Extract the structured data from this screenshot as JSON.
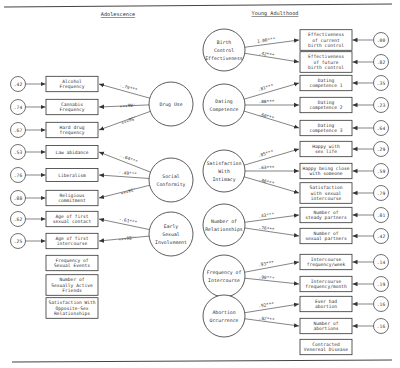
{
  "headers": {
    "left": "Adolescence",
    "right": "Young Adulthood"
  },
  "adolescence": {
    "latents": [
      {
        "id": "drug-use",
        "label": [
          "Drug Use"
        ],
        "cx": 171,
        "cy": 104,
        "r": 22,
        "indicators": [
          {
            "label": [
              "Alcohol",
              "Frequency"
            ],
            "coef": "-.79***",
            "error": ".42",
            "y": 84
          },
          {
            "label": [
              "Cannabis",
              "Frequency"
            ],
            "coef": ".86***",
            "error": ".74",
            "y": 107
          },
          {
            "label": [
              "Hard drug",
              "frequency"
            ],
            "coef": ".58***",
            "error": ".67",
            "y": 130
          }
        ]
      },
      {
        "id": "social-conformity",
        "label": [
          "Social",
          "Conformity"
        ],
        "cx": 171,
        "cy": 180,
        "r": 22,
        "indicators": [
          {
            "label": [
              "Law abidance"
            ],
            "coef": "-.64***",
            "error": ".53",
            "y": 152
          },
          {
            "label": [
              "Liberalism"
            ],
            "coef": "-.49***",
            "error": ".76",
            "y": 175
          },
          {
            "label": [
              "Religious",
              "commitment"
            ],
            "coef": ".34***",
            "error": ".88",
            "y": 198
          }
        ]
      },
      {
        "id": "early-sexual-involvement",
        "label": [
          "Early",
          "Sexual",
          "Involvement"
        ],
        "cx": 171,
        "cy": 234,
        "r": 22,
        "indicators": [
          {
            "label": [
              "Age of first",
              "sexual contact"
            ],
            "coef": "-.61***",
            "error": ".62",
            "y": 219
          },
          {
            "label": [
              "Age of first",
              "intercourse"
            ],
            "coef": "-.86***",
            "error": ".25",
            "y": 241
          }
        ]
      }
    ],
    "standalone_boxes": [
      {
        "label": [
          "Frequency of",
          "Sexual Events"
        ],
        "y": 263
      },
      {
        "label": [
          "Number of",
          "Sexually Active",
          "Friends"
        ],
        "y": 285
      },
      {
        "label": [
          "Satisfaction With",
          "Opposite-Sex",
          "Relationships"
        ],
        "y": 308
      }
    ]
  },
  "young_adulthood": {
    "latents": [
      {
        "id": "birth-control-effectiveness",
        "label": [
          "Birth",
          "Control",
          "Effectiveness"
        ],
        "cx": 224,
        "cy": 50,
        "r": 21,
        "indicators": [
          {
            "label": [
              "Effectiveness",
              "of current",
              "birth control"
            ],
            "coef": "1.00***",
            "error": ".00",
            "y": 40
          },
          {
            "label": [
              "Effectiveness",
              "of future",
              "birth control"
            ],
            "coef": ".42***",
            "error": ".82",
            "y": 62
          }
        ]
      },
      {
        "id": "dating-competence",
        "label": [
          "Dating",
          "Competence"
        ],
        "cx": 224,
        "cy": 105,
        "r": 21,
        "indicators": [
          {
            "label": [
              "Dating",
              "competence 1"
            ],
            "coef": ".81***",
            "error": ".35",
            "y": 83
          },
          {
            "label": [
              "Dating",
              "competence 2"
            ],
            "coef": ".88***",
            "error": ".23",
            "y": 105
          },
          {
            "label": [
              "Dating",
              "competence 3"
            ],
            "coef": ".60***",
            "error": ".64",
            "y": 128
          }
        ]
      },
      {
        "id": "satisfaction-with-intimacy",
        "label": [
          "Satisfaction",
          "With",
          "Intimacy"
        ],
        "cx": 224,
        "cy": 171,
        "r": 21,
        "indicators": [
          {
            "label": [
              "Happy with",
              "sex life"
            ],
            "coef": ".85***",
            "error": ".29",
            "y": 149
          },
          {
            "label": [
              "Happy being close",
              "with someone"
            ],
            "coef": ".63***",
            "error": ".59",
            "y": 171
          },
          {
            "label": [
              "Satisfaction",
              "with sexual",
              "intercourse"
            ],
            "coef": ".46***",
            "error": ".79",
            "y": 193
          }
        ]
      },
      {
        "id": "number-of-relationships",
        "label": [
          "Number of",
          "Relationships"
        ],
        "cx": 224,
        "cy": 225,
        "r": 21,
        "indicators": [
          {
            "label": [
              "Number of",
              "steady partners"
            ],
            "coef": ".43***",
            "error": ".81",
            "y": 215
          },
          {
            "label": [
              "Number of",
              "sexual partners"
            ],
            "coef": ".76***",
            "error": ".42",
            "y": 236
          }
        ]
      },
      {
        "id": "frequency-of-intercourse",
        "label": [
          "Frequency of",
          "Intercourse"
        ],
        "cx": 224,
        "cy": 276,
        "r": 21,
        "indicators": [
          {
            "label": [
              "Intercourse",
              "frequency/week"
            ],
            "coef": ".93***",
            "error": ".14",
            "y": 262
          },
          {
            "label": [
              "Intercourse",
              "frequency/month"
            ],
            "coef": ".90***",
            "error": ".19",
            "y": 284
          }
        ]
      },
      {
        "id": "abortion-occurrence",
        "label": [
          "Abortion",
          "Occurrence"
        ],
        "cx": 224,
        "cy": 316,
        "r": 21,
        "indicators": [
          {
            "label": [
              "Ever had",
              "abortion"
            ],
            "coef": ".92***",
            "error": ".16",
            "y": 304
          },
          {
            "label": [
              "Number of",
              "abortions"
            ],
            "coef": ".92***",
            "error": ".16",
            "y": 326
          }
        ]
      }
    ],
    "standalone_boxes": [
      {
        "label": [
          "Contracted",
          "Venereal Disease"
        ],
        "y": 347
      }
    ]
  },
  "colors": {
    "ink": "#333333",
    "background": "#ffffff",
    "rule": "#444444"
  }
}
